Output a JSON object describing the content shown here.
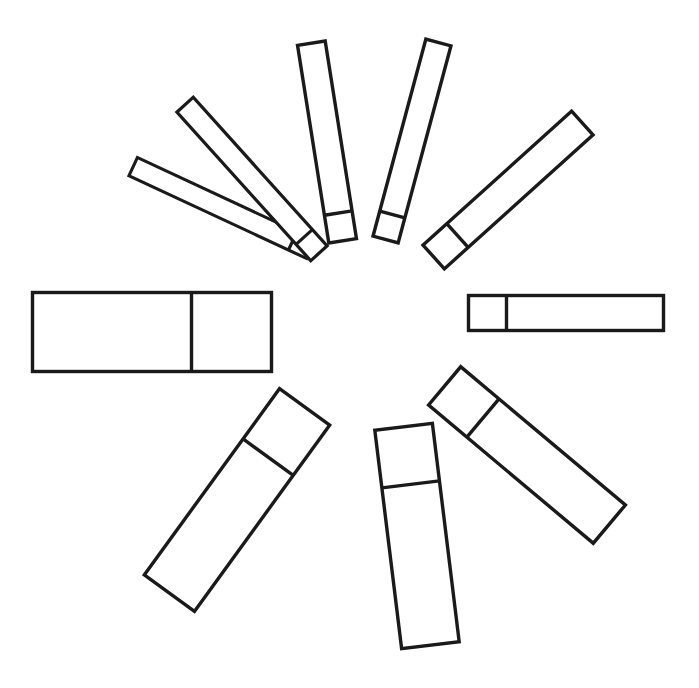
{
  "figure": {
    "title": "Radial arrangement of ten subdivided rectangles",
    "background_color": "#ffffff",
    "stroke_color": "#1a1a1a",
    "fill_color": "#ffffff",
    "canvas_width": 699,
    "canvas_height": 688,
    "center_x": 348,
    "center_y": 332
  },
  "chart_data": {
    "type": "bar",
    "title": "Radial arrangement of ten subdivided rectangles",
    "xlabel": "",
    "ylabel": "",
    "layout": "radial",
    "grid": false,
    "legend": false,
    "center": [
      348,
      332
    ],
    "bar_count": 10,
    "categories": [
      "bar-east",
      "bar-northeast",
      "bar-north-northeast",
      "bar-north-northwest",
      "bar-northwest",
      "bar-west-northwest",
      "bar-west",
      "bar-southwest",
      "bar-south",
      "bar-southeast"
    ],
    "values": [
      195,
      200,
      210,
      210,
      200,
      195,
      239,
      230,
      220,
      215
    ],
    "widths": [
      35,
      32,
      26,
      28,
      22,
      20,
      79,
      62,
      58,
      50
    ],
    "angles_deg": [
      0,
      -45,
      -75,
      -105,
      -135,
      -160,
      180,
      125,
      97,
      60
    ],
    "inner_radius": [
      120,
      120,
      120,
      120,
      120,
      120,
      76,
      88,
      96,
      104
    ],
    "series": [
      {
        "name": "outer segment length",
        "values": [
          157,
          168,
          184,
          182,
          178,
          175,
          159,
          168,
          162,
          165
        ]
      },
      {
        "name": "inner segment length",
        "values": [
          38,
          32,
          26,
          28,
          22,
          20,
          80,
          62,
          58,
          50
        ]
      }
    ],
    "bars": [
      {
        "id": "bar-west",
        "label": "West bar",
        "cx": 152,
        "cy": 332,
        "length": 239,
        "width": 79,
        "rotation": 180,
        "inner_split": 80
      },
      {
        "id": "bar-west-northwest",
        "label": "West-northwest bar",
        "cx": 222,
        "cy": 208,
        "length": 196,
        "width": 20,
        "rotation": -155,
        "inner_split": 20
      },
      {
        "id": "bar-northwest",
        "label": "Northwest bar",
        "cx": 252,
        "cy": 179,
        "length": 200,
        "width": 22,
        "rotation": -132,
        "inner_split": 22
      },
      {
        "id": "bar-north-northwest",
        "label": "North-northwest bar",
        "cx": 327,
        "cy": 142,
        "length": 200,
        "width": 28,
        "rotation": -99,
        "inner_split": 28
      },
      {
        "id": "bar-north-northeast",
        "label": "North-northeast bar",
        "cx": 412,
        "cy": 141,
        "length": 204,
        "width": 26,
        "rotation": -75,
        "inner_split": 26
      },
      {
        "id": "bar-northeast",
        "label": "Northeast bar",
        "cx": 508,
        "cy": 190,
        "length": 200,
        "width": 32,
        "rotation": -42,
        "inner_split": 32
      },
      {
        "id": "bar-east",
        "label": "East bar",
        "cx": 566,
        "cy": 313,
        "length": 195,
        "width": 35,
        "rotation": 0,
        "inner_split": 38
      },
      {
        "id": "bar-southeast",
        "label": "Southeast bar",
        "cx": 527,
        "cy": 455,
        "length": 215,
        "width": 50,
        "rotation": 40,
        "inner_split": 50
      },
      {
        "id": "bar-south",
        "label": "South bar",
        "cx": 417,
        "cy": 536,
        "length": 220,
        "width": 58,
        "rotation": 83,
        "inner_split": 58
      },
      {
        "id": "bar-southwest",
        "label": "Southwest bar",
        "cx": 237,
        "cy": 500,
        "length": 230,
        "width": 62,
        "rotation": 126,
        "inner_split": 62
      }
    ]
  }
}
